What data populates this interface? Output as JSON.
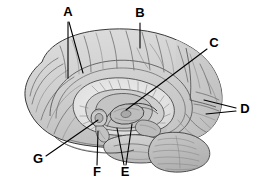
{
  "figure": {
    "type": "anatomical-diagram",
    "background_color": "#ffffff",
    "line_color": "#000000",
    "label_font_weight": "bold",
    "label_font_size_px": 13,
    "fill_colors": {
      "cortex_light": "#d8d8d8",
      "cortex_mid": "#c6c6c6",
      "cortex_dark": "#b4b4b4",
      "corpus_callosum": "#e4e4e4",
      "deep_structures": "#bdbdbd",
      "brainstem": "#c9c9c9",
      "cerebellum": "#bfbfbf"
    },
    "labels": [
      {
        "id": "A",
        "text": "A",
        "x": 68,
        "y": 13,
        "leader_count": 2
      },
      {
        "id": "B",
        "text": "B",
        "x": 140,
        "y": 14,
        "leader_count": 1
      },
      {
        "id": "C",
        "text": "C",
        "x": 214,
        "y": 44,
        "leader_count": 1
      },
      {
        "id": "D",
        "text": "D",
        "x": 245,
        "y": 110,
        "leader_count": 2
      },
      {
        "id": "E",
        "text": "E",
        "x": 125,
        "y": 173,
        "leader_count": 2
      },
      {
        "id": "F",
        "text": "F",
        "x": 97,
        "y": 173,
        "leader_count": 1
      },
      {
        "id": "G",
        "text": "G",
        "x": 38,
        "y": 160,
        "leader_count": 1
      }
    ]
  }
}
